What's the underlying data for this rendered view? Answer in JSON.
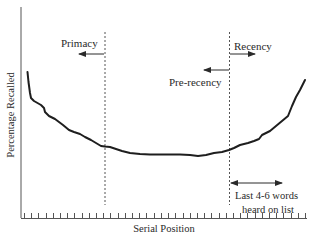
{
  "chart_data": {
    "type": "line",
    "title": "",
    "xlabel": "Serial Position",
    "ylabel": "Percentage Recalled",
    "grid": false,
    "legend": null,
    "x_ticks": 40,
    "tick_labels": [],
    "series": [
      {
        "name": "Serial position curve",
        "x": [
          0,
          0.5,
          2,
          5,
          8,
          12,
          15,
          18,
          21,
          24,
          28,
          30,
          33,
          35,
          38,
          40
        ],
        "values": [
          72,
          60,
          52,
          43,
          37,
          32,
          30,
          29,
          29,
          28.5,
          31,
          35,
          40,
          44,
          53,
          70
        ]
      }
    ],
    "ylim": [
      0,
      100
    ],
    "xlim": [
      0,
      40
    ],
    "annotations": [
      {
        "text": "Primacy",
        "arrow": "left",
        "at_line": "primacy-boundary"
      },
      {
        "text": "Recency",
        "arrow": "right",
        "at_line": "recency-boundary"
      },
      {
        "text": "Pre-recency",
        "arrow": "left",
        "at_line": "recency-boundary"
      },
      {
        "text": "Last 4-6 words heard on list",
        "arrow": "both",
        "at_line": "recency-boundary"
      }
    ],
    "vertical_lines": [
      {
        "name": "primacy-boundary",
        "style": "dashed",
        "x_fraction": 0.29
      },
      {
        "name": "recency-boundary",
        "style": "dashed",
        "x_fraction": 0.73
      }
    ]
  },
  "labels": {
    "xlabel": "Serial Position",
    "ylabel": "Percentage Recalled",
    "primacy": "Primacy",
    "recency": "Recency",
    "pre_recency": "Pre-recency",
    "last_words_line1": "Last 4-6 words",
    "last_words_line2": "heard on list"
  },
  "colors": {
    "ink": "#2a2a2a",
    "curve": "#1e1e1e",
    "background": "#ffffff"
  }
}
